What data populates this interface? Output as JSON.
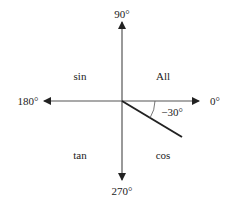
{
  "diagram": {
    "angles": {
      "top": "90°",
      "left": "180°",
      "right": "0°",
      "bottom": "270°"
    },
    "quadrants": {
      "q1": "All",
      "q2": "sin",
      "q3": "tan",
      "q4": "cos"
    },
    "angle_marker": "−30°",
    "colors": {
      "axis": "#333333",
      "ray": "#222222",
      "text": "#222222"
    }
  }
}
